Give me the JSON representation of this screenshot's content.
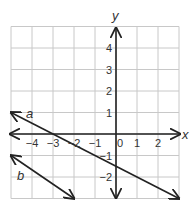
{
  "graph": {
    "x_axis_label": "x",
    "y_axis_label": "y",
    "x_ticks": [
      {
        "value": -4,
        "label": "−4"
      },
      {
        "value": -3,
        "label": "−3"
      },
      {
        "value": -2,
        "label": "−2"
      },
      {
        "value": -1,
        "label": "−1"
      },
      {
        "value": 0,
        "label": "0"
      },
      {
        "value": 1,
        "label": "1"
      },
      {
        "value": 2,
        "label": "2"
      }
    ],
    "y_ticks": [
      {
        "value": 4,
        "label": "4"
      },
      {
        "value": 3,
        "label": "3"
      },
      {
        "value": 2,
        "label": "2"
      },
      {
        "value": 1,
        "label": "1"
      },
      {
        "value": -1,
        "label": "−1"
      },
      {
        "value": -2,
        "label": "−2"
      }
    ],
    "grid": {
      "x_min": -5,
      "x_max": 3,
      "y_min": -3,
      "y_max": 5
    },
    "lines": [
      {
        "name": "a",
        "label": "a",
        "from": [
          -5,
          1
        ],
        "to": [
          3,
          -3
        ]
      },
      {
        "name": "b",
        "label": "b",
        "from": [
          -5,
          -1
        ],
        "to": [
          -2,
          -3
        ]
      }
    ],
    "colors": {
      "grid": "#c8c8c8",
      "axis": "#222222",
      "line": "#222222",
      "text": "#333333"
    }
  }
}
